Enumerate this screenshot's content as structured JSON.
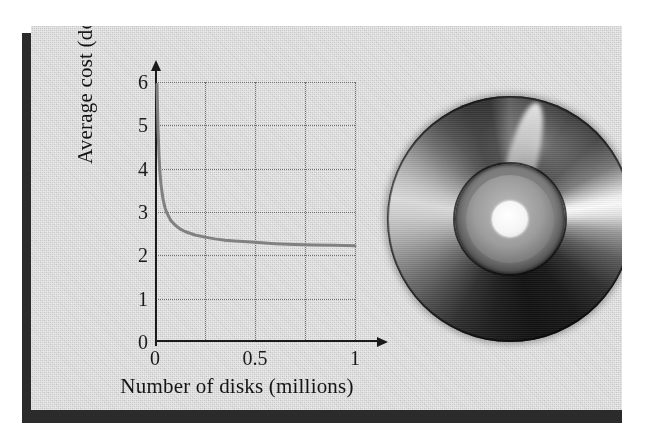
{
  "figure": {
    "panel_background": "#cfcfcf",
    "shadow_color": "#2b2b2b",
    "ink_color": "#1b1b1b"
  },
  "chart_data": {
    "type": "line",
    "title": "",
    "xlabel": "Number of disks (millions)",
    "ylabel": "Average cost (dollars)",
    "xlim": [
      0,
      1.12
    ],
    "ylim": [
      0,
      6.4
    ],
    "xticks": [
      0,
      0.5,
      1
    ],
    "xticklabels": [
      "0",
      "0.5",
      "1"
    ],
    "yticks": [
      0,
      1,
      2,
      3,
      4,
      5,
      6
    ],
    "yticklabels": [
      "0",
      "1",
      "2",
      "3",
      "4",
      "5",
      "6"
    ],
    "gridlines_x": [
      0.25,
      0.5,
      0.75,
      1
    ],
    "gridlines_y": [
      1,
      2,
      3,
      4,
      5,
      6
    ],
    "grid": true,
    "legend": "none",
    "series": [
      {
        "name": "Average cost",
        "color": "#818181",
        "line_width": 3,
        "x": [
          0.01,
          0.015,
          0.02,
          0.025,
          0.03,
          0.04,
          0.05,
          0.06,
          0.08,
          0.1,
          0.125,
          0.15,
          0.175,
          0.2,
          0.25,
          0.3,
          0.35,
          0.4,
          0.5,
          0.6,
          0.7,
          0.8,
          0.9,
          1.0
        ],
        "y": [
          5.95,
          4.93,
          4.3,
          3.9,
          3.63,
          3.3,
          3.1,
          2.97,
          2.8,
          2.7,
          2.61,
          2.55,
          2.51,
          2.47,
          2.42,
          2.38,
          2.35,
          2.33,
          2.3,
          2.27,
          2.25,
          2.24,
          2.23,
          2.22
        ],
        "model": "average cost = fixed cost / quantity + variable cost",
        "asymptote": 2.2
      }
    ]
  },
  "illustration": {
    "label": "compact-disc",
    "center_hole_color": "#ffffff",
    "disc_colors": [
      "#111111",
      "#4c4c4c",
      "#9c9c9c",
      "#dcdcdc",
      "#fbfbfb"
    ]
  }
}
